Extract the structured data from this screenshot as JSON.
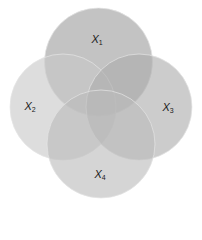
{
  "diagram": {
    "type": "venn",
    "sets": [
      {
        "id": "x1",
        "name": "X",
        "subscript": "1",
        "cx": 98.5,
        "cy": 62,
        "r": 54,
        "fill": "#9e9e9e",
        "opacity": 0.62,
        "label_x": 97,
        "label_y": 40
      },
      {
        "id": "x2",
        "name": "X",
        "subscript": "2",
        "cx": 63,
        "cy": 107,
        "r": 53,
        "fill": "#c8c8c8",
        "opacity": 0.62,
        "label_x": 30,
        "label_y": 107
      },
      {
        "id": "x3",
        "name": "X",
        "subscript": "3",
        "cx": 139,
        "cy": 107,
        "r": 53,
        "fill": "#acacac",
        "opacity": 0.62,
        "label_x": 168,
        "label_y": 108
      },
      {
        "id": "x4",
        "name": "X",
        "subscript": "4",
        "cx": 101,
        "cy": 144,
        "r": 54,
        "fill": "#bcbcbc",
        "opacity": 0.62,
        "label_x": 100,
        "label_y": 175
      }
    ],
    "outline_color": "#e6e6e6"
  }
}
